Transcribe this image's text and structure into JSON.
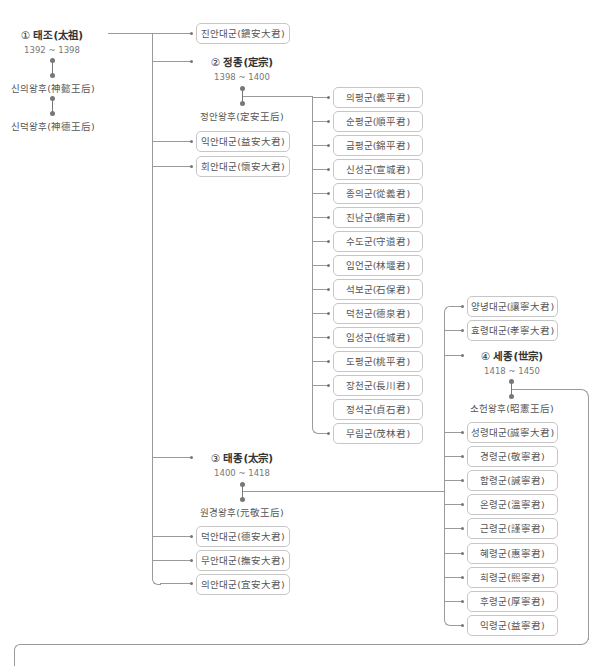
{
  "taejo": {
    "num": "①",
    "name": "태조(太祖)",
    "years": "1392 ~ 1398",
    "queens": [
      "신의왕후(神懿王后)",
      "신덕왕후(神德王后)"
    ]
  },
  "taejo_children": {
    "jinan": "진안대군(鎭安大君)",
    "ikan": "익안대군(益安大君)",
    "hoean": "회안대군(懷安大君)",
    "deogan": "덕안대군(德安大君)",
    "muan": "무안대군(撫安大君)",
    "uian": "의안대군(宜安大君)"
  },
  "jeongjong": {
    "num": "②",
    "name": "정종(定宗)",
    "years": "1398 ~ 1400",
    "queen": "정안왕후(定安王后)"
  },
  "jeongjong_children": [
    "의평군(義平君)",
    "순평군(順平君)",
    "금평군(錦平君)",
    "신성군(宣城君)",
    "종의군(從義君)",
    "진남군(鎭南君)",
    "수도군(守道君)",
    "임언군(林堰君)",
    "석보군(石保君)",
    "덕천군(德泉君)",
    "임성군(任城君)",
    "도평군(桃平君)",
    "장천군(長川君)",
    "정석군(貞石君)",
    "무림군(茂林君)"
  ],
  "taejong": {
    "num": "③",
    "name": "태종(太宗)",
    "years": "1400 ~ 1418",
    "queen": "원경왕후(元敬王后)"
  },
  "taejong_children_top": [
    "양녕대군(讓寧大君)",
    "효령대군(孝寧大君)"
  ],
  "sejong": {
    "num": "④",
    "name": "세종(世宗)",
    "years": "1418 ~ 1450",
    "queen": "소헌왕후(昭憲王后)"
  },
  "taejong_children_bottom": [
    "성령대군(誠寧大君)",
    "경령군(敬寧君)",
    "함령군(諴寧君)",
    "온령군(溫寧君)",
    "근령군(謹寧君)",
    "혜령군(惠寧君)",
    "희령군(熙寧君)",
    "후령군(厚寧君)",
    "익령군(益寧君)"
  ]
}
